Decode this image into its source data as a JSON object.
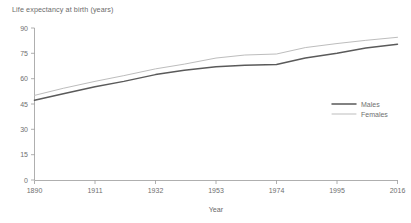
{
  "chart_data": {
    "type": "line",
    "title": "Life expectancy at birth (years)",
    "xlabel": "Year",
    "ylabel": "",
    "xlim": [
      1890,
      2016
    ],
    "ylim": [
      0,
      90
    ],
    "grid": false,
    "legend_position": "right-middle",
    "x_ticks": [
      "1890",
      "1911",
      "1932",
      "1953",
      "1974",
      "1995",
      "2016"
    ],
    "y_ticks": [
      "0",
      "15",
      "30",
      "45",
      "60",
      "75",
      "90"
    ],
    "x": [
      1890,
      1900,
      1911,
      1921,
      1932,
      1942,
      1953,
      1963,
      1974,
      1984,
      1995,
      2005,
      2016
    ],
    "series": [
      {
        "name": "Males",
        "color": "#5a5a5a",
        "values": [
          47.2,
          51.1,
          55.2,
          58.4,
          62.4,
          65.0,
          67.1,
          67.9,
          68.4,
          72.2,
          75.0,
          78.1,
          80.4
        ]
      },
      {
        "name": "Females",
        "color": "#bdbdbd",
        "values": [
          50.1,
          54.3,
          58.4,
          61.8,
          65.8,
          68.6,
          72.2,
          74.0,
          74.6,
          78.4,
          80.8,
          82.7,
          84.5
        ]
      }
    ]
  },
  "legend": {
    "items": [
      {
        "label": "Males",
        "color": "#5a5a5a"
      },
      {
        "label": "Females",
        "color": "#bdbdbd"
      }
    ]
  },
  "colors": {
    "males": "#5a5a5a",
    "females": "#bdbdbd",
    "axis": "#9a9a9a",
    "text": "#6b6b6b",
    "background": "#ffffff"
  }
}
